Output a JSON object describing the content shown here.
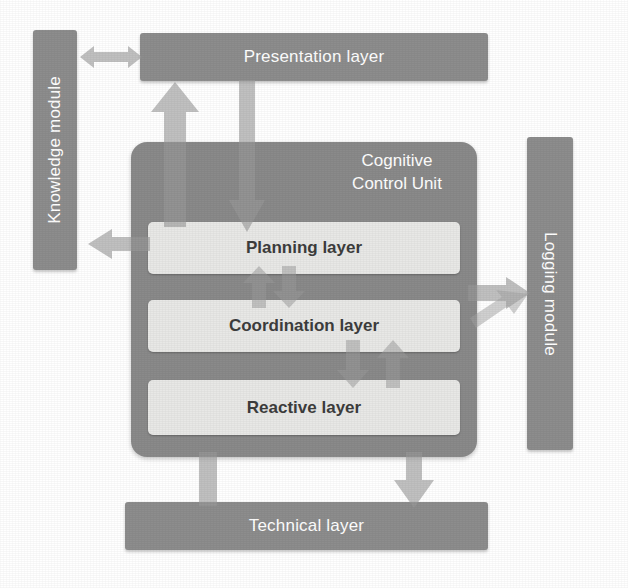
{
  "diagram": {
    "canvas": {
      "width": 628,
      "height": 588,
      "background": "#ffffff"
    },
    "colors": {
      "module_fill": "#8d8d8d",
      "module_text": "#ffffff",
      "container_fill": "#8a8a8a",
      "layer_fill": "#e8e8e6",
      "layer_text": "#3d3d3d",
      "arrow_fill": "#9a9a9a"
    }
  },
  "nodes": {
    "knowledge_module": {
      "label": "Knowledge module",
      "orientation": "vertical-bottom-to-top"
    },
    "presentation_layer": {
      "label": "Presentation layer",
      "orientation": "horizontal"
    },
    "logging_module": {
      "label": "Logging module",
      "orientation": "vertical-top-to-bottom"
    },
    "technical_layer": {
      "label": "Technical layer",
      "orientation": "horizontal"
    },
    "cognitive_control_unit": {
      "label": "Cognitive\nControl Unit",
      "layers": [
        {
          "id": "planning-layer",
          "label": "Planning layer"
        },
        {
          "id": "coordination-layer",
          "label": "Coordination layer"
        },
        {
          "id": "reactive-layer",
          "label": "Reactive layer"
        }
      ]
    }
  },
  "connectors": [
    {
      "id": "knowledge-to-presentation",
      "from": "knowledge_module",
      "to": "presentation_layer",
      "direction": "bidirectional",
      "orientation": "horizontal"
    },
    {
      "id": "ccu-to-presentation",
      "from": "cognitive_control_unit",
      "to": "presentation_layer",
      "direction": "up",
      "orientation": "vertical"
    },
    {
      "id": "presentation-to-planning",
      "from": "presentation_layer",
      "to": "planning-layer",
      "direction": "down",
      "orientation": "vertical"
    },
    {
      "id": "planning-to-knowledge",
      "from": "planning-layer",
      "to": "knowledge_module",
      "direction": "left",
      "orientation": "horizontal"
    },
    {
      "id": "ccu-to-logging",
      "from": "cognitive_control_unit",
      "to": "logging_module",
      "direction": "right",
      "orientation": "horizontal"
    },
    {
      "id": "planning-coordination-up",
      "from": "coordination-layer",
      "to": "planning-layer",
      "direction": "up",
      "orientation": "vertical"
    },
    {
      "id": "planning-coordination-down",
      "from": "planning-layer",
      "to": "coordination-layer",
      "direction": "down",
      "orientation": "vertical"
    },
    {
      "id": "coordination-reactive-down",
      "from": "coordination-layer",
      "to": "reactive-layer",
      "direction": "down",
      "orientation": "vertical"
    },
    {
      "id": "coordination-reactive-up",
      "from": "reactive-layer",
      "to": "coordination-layer",
      "direction": "up",
      "orientation": "vertical"
    },
    {
      "id": "reactive-to-logging",
      "from": "reactive-layer",
      "to": "logging_module",
      "direction": "right",
      "orientation": "diagonal"
    },
    {
      "id": "technical-to-ccu",
      "from": "technical_layer",
      "to": "cognitive_control_unit",
      "direction": "up",
      "orientation": "vertical"
    },
    {
      "id": "ccu-to-technical",
      "from": "cognitive_control_unit",
      "to": "technical_layer",
      "direction": "down",
      "orientation": "vertical"
    }
  ]
}
